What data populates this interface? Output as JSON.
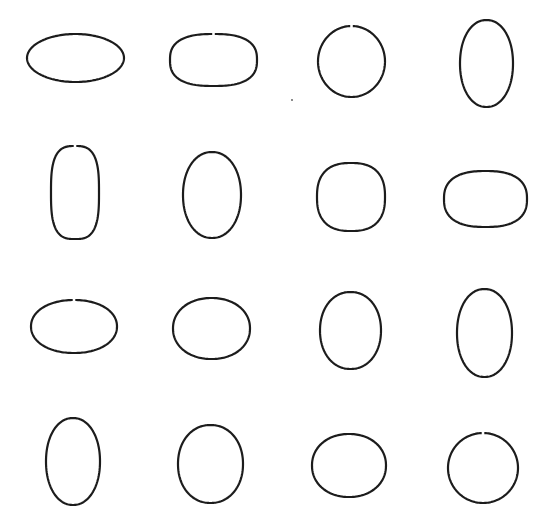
{
  "figure": {
    "rows": 4,
    "columns": 4,
    "stroke_color": "#1c1c1c",
    "background_color": "#ffffff",
    "shapes": [
      {
        "row": 1,
        "col": 1,
        "kind": "ellipse",
        "orientation": "horizontal"
      },
      {
        "row": 1,
        "col": 2,
        "kind": "superellipse",
        "orientation": "horizontal"
      },
      {
        "row": 1,
        "col": 3,
        "kind": "circle",
        "orientation": "none"
      },
      {
        "row": 1,
        "col": 4,
        "kind": "ellipse",
        "orientation": "vertical"
      },
      {
        "row": 2,
        "col": 1,
        "kind": "superellipse",
        "orientation": "vertical"
      },
      {
        "row": 2,
        "col": 2,
        "kind": "ellipse",
        "orientation": "vertical"
      },
      {
        "row": 2,
        "col": 3,
        "kind": "superellipse",
        "orientation": "none"
      },
      {
        "row": 2,
        "col": 4,
        "kind": "superellipse",
        "orientation": "horizontal"
      },
      {
        "row": 3,
        "col": 1,
        "kind": "ellipse",
        "orientation": "horizontal"
      },
      {
        "row": 3,
        "col": 2,
        "kind": "ellipse",
        "orientation": "horizontal"
      },
      {
        "row": 3,
        "col": 3,
        "kind": "ellipse",
        "orientation": "vertical"
      },
      {
        "row": 3,
        "col": 4,
        "kind": "ellipse",
        "orientation": "vertical"
      },
      {
        "row": 4,
        "col": 1,
        "kind": "ellipse",
        "orientation": "vertical"
      },
      {
        "row": 4,
        "col": 2,
        "kind": "ellipse",
        "orientation": "vertical"
      },
      {
        "row": 4,
        "col": 3,
        "kind": "ellipse",
        "orientation": "horizontal"
      },
      {
        "row": 4,
        "col": 4,
        "kind": "circle",
        "orientation": "none"
      }
    ]
  }
}
